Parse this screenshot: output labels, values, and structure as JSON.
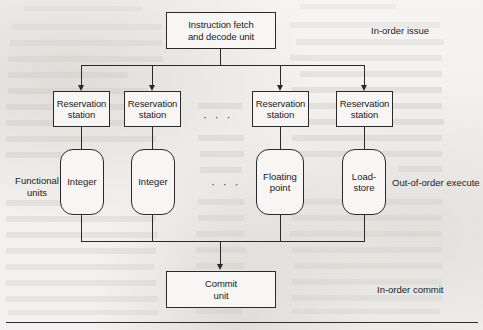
{
  "diagram": {
    "stages": {
      "issue_label": "In-order issue",
      "execute_label": "Out-of-order execute",
      "commit_label": "In-order commit"
    },
    "fetch_unit": {
      "line1": "Instruction fetch",
      "line2": "and decode unit"
    },
    "reservation_stations": [
      {
        "line1": "Reservation",
        "line2": "station"
      },
      {
        "line1": "Reservation",
        "line2": "station"
      },
      {
        "line1": "Reservation",
        "line2": "station"
      },
      {
        "line1": "Reservation",
        "line2": "station"
      }
    ],
    "functional_units_label": {
      "line1": "Functional",
      "line2": "units"
    },
    "functional_units": [
      {
        "line1": "Integer",
        "line2": ""
      },
      {
        "line1": "Integer",
        "line2": ""
      },
      {
        "line1": "Floating",
        "line2": "point"
      },
      {
        "line1": "Load-",
        "line2": "store"
      }
    ],
    "commit_unit": {
      "line1": "Commit",
      "line2": "unit"
    },
    "ellipsis_marker": "· · ·",
    "colors": {
      "stroke": "#2a2a2a",
      "box_fill": "#f7f6f4",
      "paper": "#f3f2f0",
      "ghost_text": "#d9d7d3"
    }
  }
}
